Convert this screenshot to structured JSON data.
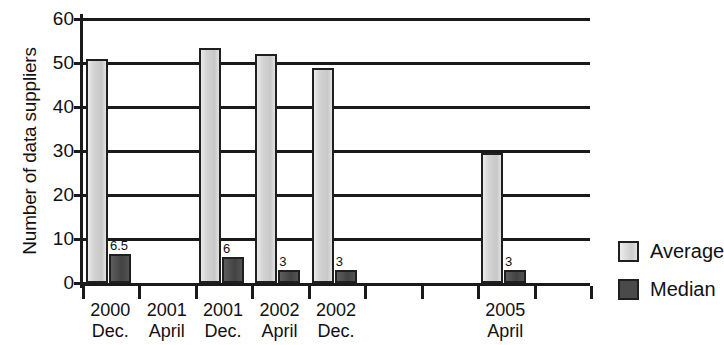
{
  "chart_data": {
    "type": "bar",
    "title": "",
    "xlabel": "",
    "ylabel": "Number of data suppliers",
    "ylim": [
      0,
      63
    ],
    "ytick_values": [
      0,
      10,
      20,
      30,
      40,
      50,
      60
    ],
    "ytick_labels": [
      "0",
      "10",
      "20",
      "30",
      "40",
      "50",
      "60"
    ],
    "grid": true,
    "legend_position": "right",
    "categories": [
      {
        "line1": "2000",
        "line2": "Dec."
      },
      {
        "line1": "2001",
        "line2": "April"
      },
      {
        "line1": "2001",
        "line2": "Dec."
      },
      {
        "line1": "2002",
        "line2": "April"
      },
      {
        "line1": "2002",
        "line2": "Dec."
      },
      {
        "line1": "",
        "line2": ""
      },
      {
        "line1": "",
        "line2": ""
      },
      {
        "line1": "2005",
        "line2": "April"
      },
      {
        "line1": "",
        "line2": ""
      }
    ],
    "series": [
      {
        "name": "Average",
        "color": "#d2d2d2",
        "values": [
          51,
          null,
          53.5,
          52,
          48.8,
          null,
          null,
          29.5,
          null
        ],
        "labels": [
          "",
          "",
          "",
          "",
          "",
          "",
          "",
          "",
          ""
        ]
      },
      {
        "name": "Median",
        "color": "#4a4a4a",
        "values": [
          6.5,
          null,
          6,
          3,
          3,
          null,
          null,
          3,
          null
        ],
        "labels": [
          "6.5",
          "",
          "6",
          "3",
          "3",
          "",
          "",
          "3",
          ""
        ]
      }
    ]
  },
  "legend": {
    "items": [
      {
        "label": "Average",
        "key": "average"
      },
      {
        "label": "Median",
        "key": "median"
      }
    ]
  }
}
